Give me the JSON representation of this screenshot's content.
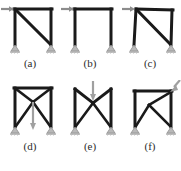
{
  "figure": {
    "title": "",
    "background_color": "#ffffff",
    "member_color": "#1a1a1a",
    "arrow_color": "#8c8c8c",
    "support_color": "#9a9a9a",
    "caption_color": "#2b2b2b",
    "footnote": ""
  },
  "panels": [
    {
      "id": "a",
      "caption": "(a)",
      "description": "portal frame with single diagonal brace from top-left to bottom-right, horizontal load at top-left joint",
      "load": {
        "type": "horizontal-arrow",
        "direction": "right",
        "location": "top-left-joint"
      },
      "bracing": "single-diagonal",
      "deformed": false,
      "supports": [
        "pinned",
        "pinned"
      ]
    },
    {
      "id": "b",
      "caption": "(b)",
      "description": "unbraced portal frame, horizontal load at top-left joint",
      "load": {
        "type": "horizontal-arrow",
        "direction": "right",
        "location": "top-left-joint"
      },
      "bracing": "none",
      "deformed": false,
      "supports": [
        "pinned",
        "pinned"
      ]
    },
    {
      "id": "c",
      "caption": "(c)",
      "description": "portal frame with single diagonal brace, deformed shape under horizontal load at top-left joint",
      "load": {
        "type": "horizontal-arrow",
        "direction": "right",
        "location": "top-left-joint"
      },
      "bracing": "single-diagonal",
      "deformed": true,
      "supports": [
        "pinned",
        "pinned"
      ]
    },
    {
      "id": "d",
      "caption": "(d)",
      "description": "X-braced frame with vertical downward load at midspan of top beam",
      "load": {
        "type": "vertical-arrow",
        "direction": "down",
        "location": "midspan-top-beam"
      },
      "bracing": "x-brace",
      "deformed": false,
      "supports": [
        "pinned",
        "pinned"
      ]
    },
    {
      "id": "e",
      "caption": "(e)",
      "description": "X-braced frame deformed with top beam sagging at midspan under vertical downward load",
      "load": {
        "type": "vertical-arrow",
        "direction": "down",
        "location": "midspan-top-beam"
      },
      "bracing": "x-brace",
      "deformed": true,
      "supports": [
        "pinned",
        "pinned"
      ]
    },
    {
      "id": "f",
      "caption": "(f)",
      "description": "braced frame deformed under inclined load applied at top-right joint",
      "load": {
        "type": "inclined-arrow",
        "direction": "down-left",
        "location": "top-right-joint"
      },
      "bracing": "x-brace",
      "deformed": true,
      "supports": [
        "pinned",
        "pinned"
      ]
    }
  ]
}
